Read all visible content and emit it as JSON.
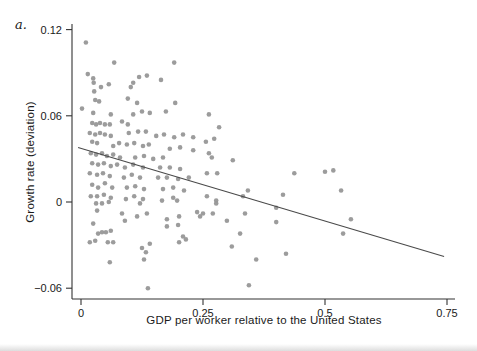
{
  "figure": {
    "panel_label": "a.",
    "x_axis_label": "GDP per worker relative to the United States",
    "y_axis_label": "Growth rate (deviation)"
  },
  "chart_data": {
    "type": "scatter",
    "title": "",
    "xlabel": "GDP per worker relative to the United States",
    "ylabel": "Growth rate (deviation)",
    "xlim": [
      -0.02,
      0.78
    ],
    "ylim": [
      -0.068,
      0.125
    ],
    "grid": false,
    "legend": "none",
    "x_ticks": [
      0,
      0.25,
      0.5,
      0.75
    ],
    "x_tick_labels": [
      "0",
      "0.25",
      "0.5",
      "0.75"
    ],
    "y_ticks": [
      -0.06,
      0,
      0.06,
      0.12
    ],
    "y_tick_labels": [
      "−0.06",
      "0",
      "0.06",
      "0.12"
    ],
    "trend_line": {
      "x1": -0.006,
      "y1": 0.038,
      "x2": 0.744,
      "y2": -0.038,
      "slope": -0.101,
      "intercept": 0.038
    },
    "colors": {
      "point": "#979797",
      "trend": "#4a4a4a",
      "axis": "#333333",
      "text": "#1a1a1a"
    },
    "points": [
      [
        0.01,
        0.111
      ],
      [
        0.068,
        0.097
      ],
      [
        0.191,
        0.097
      ],
      [
        0.014,
        0.089
      ],
      [
        0.025,
        0.086
      ],
      [
        0.026,
        0.083
      ],
      [
        0.041,
        0.08
      ],
      [
        0.057,
        0.082
      ],
      [
        0.027,
        0.077
      ],
      [
        0.102,
        0.08
      ],
      [
        0.107,
        0.083
      ],
      [
        0.119,
        0.087
      ],
      [
        0.135,
        0.088
      ],
      [
        0.164,
        0.085
      ],
      [
        0.029,
        0.071
      ],
      [
        0.037,
        0.07
      ],
      [
        0.096,
        0.072
      ],
      [
        0.115,
        0.069
      ],
      [
        0.193,
        0.069
      ],
      [
        0.002,
        0.065
      ],
      [
        0.025,
        0.062
      ],
      [
        0.061,
        0.061
      ],
      [
        0.107,
        0.061
      ],
      [
        0.125,
        0.063
      ],
      [
        0.141,
        0.062
      ],
      [
        0.174,
        0.063
      ],
      [
        0.023,
        0.055
      ],
      [
        0.031,
        0.054
      ],
      [
        0.039,
        0.055
      ],
      [
        0.049,
        0.054
      ],
      [
        0.059,
        0.054
      ],
      [
        0.084,
        0.056
      ],
      [
        0.096,
        0.054
      ],
      [
        0.018,
        0.048
      ],
      [
        0.029,
        0.047
      ],
      [
        0.039,
        0.048
      ],
      [
        0.049,
        0.047
      ],
      [
        0.061,
        0.046
      ],
      [
        0.098,
        0.048
      ],
      [
        0.117,
        0.049
      ],
      [
        0.133,
        0.049
      ],
      [
        0.154,
        0.046
      ],
      [
        0.17,
        0.047
      ],
      [
        0.191,
        0.045
      ],
      [
        0.209,
        0.047
      ],
      [
        0.23,
        0.045
      ],
      [
        0.023,
        0.042
      ],
      [
        0.033,
        0.041
      ],
      [
        0.066,
        0.039
      ],
      [
        0.078,
        0.041
      ],
      [
        0.094,
        0.04
      ],
      [
        0.109,
        0.041
      ],
      [
        0.127,
        0.039
      ],
      [
        0.139,
        0.04
      ],
      [
        0.182,
        0.037
      ],
      [
        0.203,
        0.038
      ],
      [
        0.23,
        0.036
      ],
      [
        0.02,
        0.034
      ],
      [
        0.031,
        0.033
      ],
      [
        0.043,
        0.034
      ],
      [
        0.053,
        0.032
      ],
      [
        0.066,
        0.033
      ],
      [
        0.08,
        0.031
      ],
      [
        0.111,
        0.031
      ],
      [
        0.129,
        0.032
      ],
      [
        0.148,
        0.03
      ],
      [
        0.168,
        0.031
      ],
      [
        0.023,
        0.027
      ],
      [
        0.035,
        0.026
      ],
      [
        0.047,
        0.027
      ],
      [
        0.061,
        0.025
      ],
      [
        0.074,
        0.026
      ],
      [
        0.09,
        0.024
      ],
      [
        0.107,
        0.026
      ],
      [
        0.127,
        0.024
      ],
      [
        0.162,
        0.024
      ],
      [
        0.182,
        0.024
      ],
      [
        0.203,
        0.023
      ],
      [
        0.018,
        0.02
      ],
      [
        0.033,
        0.019
      ],
      [
        0.045,
        0.02
      ],
      [
        0.059,
        0.018
      ],
      [
        0.088,
        0.017
      ],
      [
        0.104,
        0.019
      ],
      [
        0.121,
        0.017
      ],
      [
        0.158,
        0.017
      ],
      [
        0.176,
        0.017
      ],
      [
        0.199,
        0.016
      ],
      [
        0.221,
        0.017
      ],
      [
        0.023,
        0.012
      ],
      [
        0.035,
        0.01
      ],
      [
        0.049,
        0.013
      ],
      [
        0.064,
        0.01
      ],
      [
        0.094,
        0.01
      ],
      [
        0.111,
        0.011
      ],
      [
        0.129,
        0.009
      ],
      [
        0.168,
        0.009
      ],
      [
        0.189,
        0.01
      ],
      [
        0.211,
        0.008
      ],
      [
        0.02,
        0.004
      ],
      [
        0.033,
        0.004
      ],
      [
        0.047,
        0.005
      ],
      [
        0.061,
        0.003
      ],
      [
        0.092,
        0.002
      ],
      [
        0.109,
        0.004
      ],
      [
        0.127,
        0.002
      ],
      [
        0.166,
        0.001
      ],
      [
        0.189,
        0.003
      ],
      [
        0.262,
        0.061
      ],
      [
        0.283,
        0.052
      ],
      [
        0.256,
        0.042
      ],
      [
        0.273,
        0.044
      ],
      [
        0.262,
        0.034
      ],
      [
        0.268,
        0.031
      ],
      [
        0.311,
        0.029
      ],
      [
        0.258,
        0.02
      ],
      [
        0.279,
        0.02
      ],
      [
        0.437,
        0.02
      ],
      [
        0.5,
        0.021
      ],
      [
        0.517,
        0.022
      ],
      [
        0.342,
        0.008
      ],
      [
        0.332,
        0.004
      ],
      [
        0.414,
        0.005
      ],
      [
        0.258,
        0.004
      ],
      [
        0.277,
        0.001
      ],
      [
        0.533,
        0.008
      ],
      [
        0.031,
        -0.001
      ],
      [
        0.043,
        -0.001
      ],
      [
        0.057,
        0.0
      ],
      [
        0.033,
        -0.006
      ],
      [
        0.084,
        -0.008
      ],
      [
        0.121,
        -0.001
      ],
      [
        0.135,
        -0.008
      ],
      [
        0.197,
        0.001
      ],
      [
        0.025,
        -0.015
      ],
      [
        0.09,
        -0.013
      ],
      [
        0.115,
        -0.01
      ],
      [
        0.176,
        -0.012
      ],
      [
        0.201,
        -0.01
      ],
      [
        0.238,
        -0.007
      ],
      [
        0.035,
        -0.022
      ],
      [
        0.043,
        -0.021
      ],
      [
        0.051,
        -0.021
      ],
      [
        0.061,
        -0.02
      ],
      [
        0.176,
        -0.017
      ],
      [
        0.199,
        -0.016
      ],
      [
        0.018,
        -0.028
      ],
      [
        0.029,
        -0.027
      ],
      [
        0.055,
        -0.028
      ],
      [
        0.066,
        -0.028
      ],
      [
        0.209,
        -0.024
      ],
      [
        0.215,
        -0.026
      ],
      [
        0.201,
        -0.028
      ],
      [
        0.125,
        -0.032
      ],
      [
        0.133,
        -0.035
      ],
      [
        0.141,
        -0.029
      ],
      [
        0.129,
        -0.04
      ],
      [
        0.059,
        -0.042
      ],
      [
        0.137,
        -0.06
      ],
      [
        0.277,
        -0.001
      ],
      [
        0.25,
        -0.008
      ],
      [
        0.27,
        -0.008
      ],
      [
        0.244,
        -0.01
      ],
      [
        0.299,
        -0.013
      ],
      [
        0.336,
        -0.008
      ],
      [
        0.326,
        -0.022
      ],
      [
        0.309,
        -0.031
      ],
      [
        0.359,
        -0.04
      ],
      [
        0.42,
        -0.036
      ],
      [
        0.344,
        -0.058
      ],
      [
        0.4,
        -0.004
      ],
      [
        0.4,
        -0.014
      ],
      [
        0.553,
        -0.012
      ],
      [
        0.537,
        -0.022
      ]
    ]
  }
}
